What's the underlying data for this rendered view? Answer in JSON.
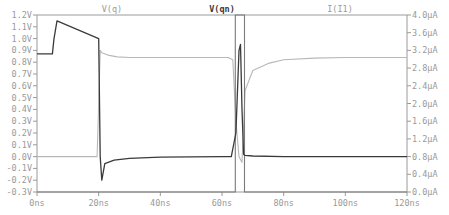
{
  "chart_data": {
    "type": "line",
    "title": "",
    "legend": [
      {
        "name": "V(q)",
        "color": "#b8b8b8",
        "axis": "left",
        "label_x": 112
      },
      {
        "name": "V(qn)",
        "color": "#3a3a3a",
        "axis": "left",
        "label_x": 222,
        "bold": true
      },
      {
        "name": "I(I1)",
        "color": "#7a7a7a",
        "axis": "right",
        "label_x": 340
      }
    ],
    "xlabel": "time",
    "xlim": [
      0,
      120
    ],
    "x_ticks": [
      "0ns",
      "20ns",
      "40ns",
      "60ns",
      "80ns",
      "100ns",
      "120ns"
    ],
    "y_left_label": "Voltage",
    "y_left_lim": [
      -0.3,
      1.2
    ],
    "y_left_ticks": [
      "1.2V",
      "1.1V",
      "1.0V",
      "0.9V",
      "0.8V",
      "0.7V",
      "0.6V",
      "0.5V",
      "0.4V",
      "0.3V",
      "0.2V",
      "0.1V",
      "0.0V",
      "-0.1V",
      "-0.2V",
      "-0.3V"
    ],
    "y_right_label": "Current",
    "y_right_lim": [
      0.0,
      4.0
    ],
    "y_right_ticks": [
      "4.0µA",
      "3.6µA",
      "3.2µA",
      "2.8µA",
      "2.4µA",
      "2.0µA",
      "1.6µA",
      "1.2µA",
      "0.8µA",
      "0.4µA",
      "0.0µA"
    ],
    "grid": false,
    "series": [
      {
        "name": "V(qn)",
        "axis": "left",
        "x": [
          0,
          5,
          5.5,
          6.5,
          20,
          20.5,
          21,
          22,
          25,
          30,
          40,
          50,
          60,
          63,
          64.5,
          65.5,
          66,
          66.5,
          67,
          67.5,
          70,
          80,
          100,
          120
        ],
        "y": [
          0.87,
          0.87,
          1.0,
          1.15,
          1.0,
          0.0,
          -0.2,
          -0.06,
          -0.03,
          -0.015,
          -0.005,
          -0.002,
          0.0,
          0.0,
          0.2,
          0.9,
          0.95,
          0.4,
          0.02,
          0.01,
          0.005,
          0.0,
          0.0,
          0.0
        ]
      },
      {
        "name": "V(q)",
        "axis": "left",
        "x": [
          0,
          19.5,
          20,
          20.5,
          21,
          23,
          26,
          30,
          40,
          50,
          62,
          63.5,
          64.5,
          65.5,
          66.5,
          67.5,
          70,
          75,
          80,
          90,
          100,
          120
        ],
        "y": [
          0.0,
          0.0,
          0.45,
          0.9,
          0.88,
          0.86,
          0.845,
          0.84,
          0.84,
          0.84,
          0.84,
          0.82,
          0.3,
          0.0,
          -0.05,
          0.56,
          0.73,
          0.79,
          0.82,
          0.835,
          0.84,
          0.84
        ]
      },
      {
        "name": "I(I1)",
        "axis": "right",
        "x": [
          0,
          64.3,
          64.3,
          67.3,
          67.3,
          120
        ],
        "y": [
          0.0,
          0.0,
          4.0,
          4.0,
          0.0,
          0.0
        ]
      }
    ]
  }
}
